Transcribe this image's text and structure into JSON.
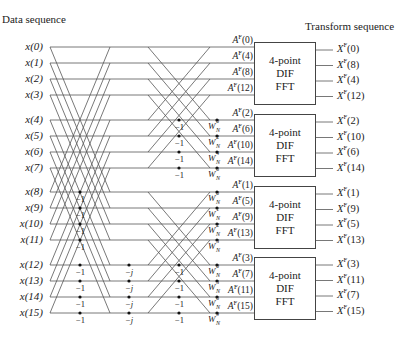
{
  "titles": {
    "input": "Data sequence",
    "output": "Transform sequence"
  },
  "inputs": [
    "x(0)",
    "x(1)",
    "x(2)",
    "x(3)",
    "x(4)",
    "x(5)",
    "x(6)",
    "x(7)",
    "x(8)",
    "x(9)",
    "x(10)",
    "x(11)",
    "x(12)",
    "x(13)",
    "x(14)",
    "x(15)"
  ],
  "row_y": [
    47,
    63,
    79,
    95,
    120,
    136,
    152,
    168,
    192,
    208,
    224,
    240,
    265,
    281,
    297,
    313
  ],
  "stage1_multipliers": {
    "rows": [
      8,
      9,
      10,
      11,
      12,
      13,
      14,
      15
    ],
    "label": "−1"
  },
  "stage2_multipliers": {
    "rows": [
      12,
      13,
      14,
      15
    ],
    "label": "−j"
  },
  "stage3_multipliers": {
    "rows": [
      4,
      5,
      6,
      7,
      12,
      13,
      14,
      15
    ],
    "label": "−1"
  },
  "twiddles": [
    {
      "row": 4,
      "exp": "0"
    },
    {
      "row": 5,
      "exp": "2"
    },
    {
      "row": 6,
      "exp": "4"
    },
    {
      "row": 7,
      "exp": "6"
    },
    {
      "row": 8,
      "exp": "0"
    },
    {
      "row": 9,
      "exp": "1"
    },
    {
      "row": 10,
      "exp": "2"
    },
    {
      "row": 11,
      "exp": "3"
    },
    {
      "row": 12,
      "exp": "0"
    },
    {
      "row": 13,
      "exp": "3"
    },
    {
      "row": 14,
      "exp": "6"
    },
    {
      "row": 15,
      "exp": "9"
    }
  ],
  "twiddle_base": "W",
  "twiddle_sub": "N",
  "blocks": [
    {
      "line1": "4-point",
      "line2": "DIF",
      "line3": "FFT",
      "a_labels": [
        "A",
        "A",
        "A",
        "A"
      ],
      "a_idx": [
        "(0)",
        "(4)",
        "(8)",
        "(12)"
      ],
      "x_idx": [
        "(0)",
        "(8)",
        "(4)",
        "(12)"
      ]
    },
    {
      "line1": "4-point",
      "line2": "DIF",
      "line3": "FFT",
      "a_idx": [
        "(2)",
        "(6)",
        "(10)",
        "(14)"
      ],
      "x_idx": [
        "(2)",
        "(10)",
        "(6)",
        "(14)"
      ]
    },
    {
      "line1": "4-point",
      "line2": "DIF",
      "line3": "FFT",
      "a_idx": [
        "(1)",
        "(5)",
        "(9)",
        "(13)"
      ],
      "x_idx": [
        "(1)",
        "(9)",
        "(5)",
        "(13)"
      ]
    },
    {
      "line1": "4-point",
      "line2": "DIF",
      "line3": "FFT",
      "a_idx": [
        "(3)",
        "(7)",
        "(11)",
        "(15)"
      ],
      "x_idx": [
        "(3)",
        "(11)",
        "(7)",
        "(15)"
      ]
    }
  ],
  "a_symbol": "A",
  "x_symbol": "X",
  "superscript": "F"
}
